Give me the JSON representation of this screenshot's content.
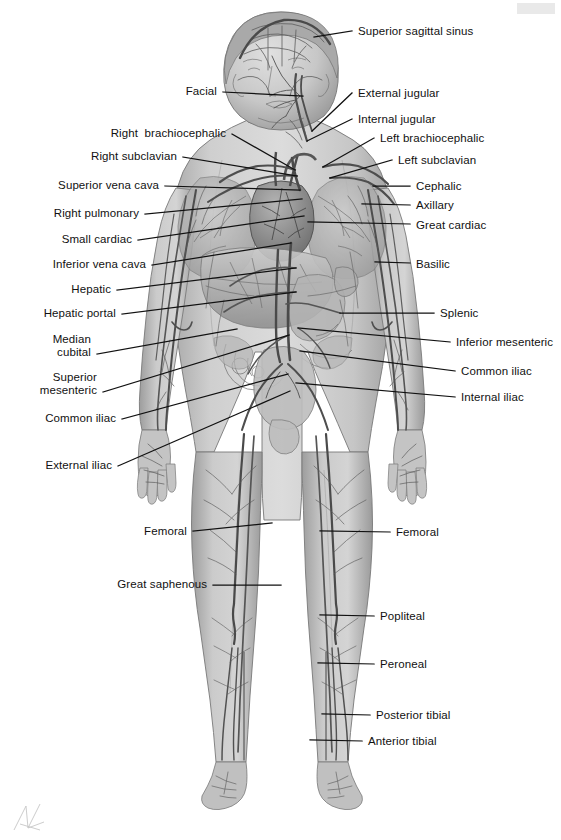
{
  "figure": {
    "view": "anterior full-body",
    "colors": {
      "background": "#ffffff",
      "body_fill_light": "#d2d2d2",
      "body_fill_mid": "#bcbcbc",
      "body_shadow": "#9a9a9a",
      "vessel_dark": "#5e5e5e",
      "vessel_mid": "#7d7d7d",
      "outline": "#6f6f6f",
      "leader_line": "#111111",
      "label_text": "#111111",
      "corner_bar": "#e9e9e9"
    }
  },
  "labels_left": [
    {
      "id": "facial",
      "text": "Facial",
      "x": 178,
      "y": 85,
      "anchor_x": 303,
      "anchor_y": 96,
      "line_x1": 223,
      "line_y1": 92
    },
    {
      "id": "right-brachiocephalic",
      "text": "Right  brachiocephalic",
      "x": 96,
      "y": 127,
      "anchor_x": 295,
      "anchor_y": 170,
      "line_x1": 232,
      "line_y1": 134
    },
    {
      "id": "right-subclavian",
      "text": "Right subclavian",
      "x": 73,
      "y": 150,
      "anchor_x": 297,
      "anchor_y": 176,
      "line_x1": 183,
      "line_y1": 157
    },
    {
      "id": "superior-vena-cava",
      "text": "Superior vena cava",
      "x": 38,
      "y": 179,
      "anchor_x": 300,
      "anchor_y": 190,
      "line_x1": 165,
      "line_y1": 186
    },
    {
      "id": "right-pulmonary",
      "text": "Right pulmonary",
      "x": 32,
      "y": 207,
      "anchor_x": 302,
      "anchor_y": 199,
      "line_x1": 145,
      "line_y1": 214
    },
    {
      "id": "small-cardiac",
      "text": "Small cardiac",
      "x": 48,
      "y": 233,
      "anchor_x": 304,
      "anchor_y": 216,
      "line_x1": 138,
      "line_y1": 240
    },
    {
      "id": "inferior-vena-cava",
      "text": "Inferior vena cava",
      "x": 30,
      "y": 258,
      "anchor_x": 291,
      "anchor_y": 243,
      "line_x1": 152,
      "line_y1": 265
    },
    {
      "id": "hepatic",
      "text": "Hepatic",
      "x": 66,
      "y": 283,
      "anchor_x": 296,
      "anchor_y": 268,
      "line_x1": 117,
      "line_y1": 290
    },
    {
      "id": "hepatic-portal",
      "text": "Hepatic portal",
      "x": 24,
      "y": 307,
      "anchor_x": 296,
      "anchor_y": 292,
      "line_x1": 122,
      "line_y1": 314
    },
    {
      "id": "median-cubital",
      "text": "Median\ncubital",
      "x": 38,
      "y": 333,
      "anchor_x": 237,
      "anchor_y": 329,
      "line_x1": 97,
      "line_y1": 354
    },
    {
      "id": "superior-mesenteric",
      "text": "Superior\nmesenteric",
      "x": 34,
      "y": 371,
      "anchor_x": 289,
      "anchor_y": 335,
      "line_x1": 103,
      "line_y1": 392
    },
    {
      "id": "common-iliac-left",
      "text": "Common iliac",
      "x": 31,
      "y": 412,
      "anchor_x": 288,
      "anchor_y": 374,
      "line_x1": 122,
      "line_y1": 419
    },
    {
      "id": "external-iliac",
      "text": "External iliac",
      "x": 29,
      "y": 459,
      "anchor_x": 290,
      "anchor_y": 391,
      "line_x1": 118,
      "line_y1": 466
    },
    {
      "id": "femoral-left",
      "text": "Femoral",
      "x": 140,
      "y": 525,
      "anchor_x": 272,
      "anchor_y": 523,
      "line_x1": 193,
      "line_y1": 531
    },
    {
      "id": "great-saphenous",
      "text": "Great saphenous",
      "x": 113,
      "y": 578,
      "anchor_x": 281,
      "anchor_y": 585,
      "line_x1": 213,
      "line_y1": 585
    }
  ],
  "labels_right": [
    {
      "id": "superior-sagittal-sinus",
      "text": "Superior sagittal sinus",
      "x": 358,
      "y": 25,
      "anchor_x": 314,
      "anchor_y": 37,
      "line_x1": 352,
      "line_y1": 31
    },
    {
      "id": "external-jugular",
      "text": "External jugular",
      "x": 358,
      "y": 87,
      "anchor_x": 312,
      "anchor_y": 131,
      "line_x1": 352,
      "line_y1": 93
    },
    {
      "id": "internal-jugular",
      "text": "Internal jugular",
      "x": 358,
      "y": 113,
      "anchor_x": 307,
      "anchor_y": 141,
      "line_x1": 352,
      "line_y1": 119
    },
    {
      "id": "left-brachiocephalic",
      "text": "Left brachiocephalic",
      "x": 380,
      "y": 132,
      "anchor_x": 323,
      "anchor_y": 167,
      "line_x1": 374,
      "line_y1": 138
    },
    {
      "id": "left-subclavian",
      "text": "Left subclavian",
      "x": 398,
      "y": 154,
      "anchor_x": 330,
      "anchor_y": 178,
      "line_x1": 392,
      "line_y1": 160
    },
    {
      "id": "cephalic",
      "text": "Cephalic",
      "x": 416,
      "y": 180,
      "anchor_x": 373,
      "anchor_y": 186,
      "line_x1": 410,
      "line_y1": 186
    },
    {
      "id": "axillary",
      "text": "Axillary",
      "x": 416,
      "y": 199,
      "anchor_x": 362,
      "anchor_y": 204,
      "line_x1": 410,
      "line_y1": 205
    },
    {
      "id": "great-cardiac",
      "text": "Great cardiac",
      "x": 416,
      "y": 219,
      "anchor_x": 308,
      "anchor_y": 222,
      "line_x1": 410,
      "line_y1": 224
    },
    {
      "id": "basilic",
      "text": "Basilic",
      "x": 416,
      "y": 258,
      "anchor_x": 375,
      "anchor_y": 262,
      "line_x1": 410,
      "line_y1": 263
    },
    {
      "id": "splenic",
      "text": "Splenic",
      "x": 440,
      "y": 307,
      "anchor_x": 340,
      "anchor_y": 313,
      "line_x1": 434,
      "line_y1": 313
    },
    {
      "id": "inferior-mesenteric",
      "text": "Inferior mesenteric",
      "x": 456,
      "y": 336,
      "anchor_x": 298,
      "anchor_y": 328,
      "line_x1": 450,
      "line_y1": 342
    },
    {
      "id": "common-iliac-right",
      "text": "Common iliac",
      "x": 461,
      "y": 365,
      "anchor_x": 300,
      "anchor_y": 351,
      "line_x1": 455,
      "line_y1": 371
    },
    {
      "id": "internal-iliac",
      "text": "Internal iliac",
      "x": 461,
      "y": 391,
      "anchor_x": 296,
      "anchor_y": 383,
      "line_x1": 455,
      "line_y1": 397
    },
    {
      "id": "femoral-right",
      "text": "Femoral",
      "x": 396,
      "y": 526,
      "anchor_x": 320,
      "anchor_y": 531,
      "line_x1": 390,
      "line_y1": 532
    },
    {
      "id": "popliteal",
      "text": "Popliteal",
      "x": 380,
      "y": 610,
      "anchor_x": 320,
      "anchor_y": 615,
      "line_x1": 374,
      "line_y1": 616
    },
    {
      "id": "peroneal",
      "text": "Peroneal",
      "x": 380,
      "y": 658,
      "anchor_x": 318,
      "anchor_y": 663,
      "line_x1": 374,
      "line_y1": 664
    },
    {
      "id": "posterior-tibial",
      "text": "Posterior tibial",
      "x": 376,
      "y": 709,
      "anchor_x": 322,
      "anchor_y": 714,
      "line_x1": 370,
      "line_y1": 715
    },
    {
      "id": "anterior-tibial",
      "text": "Anterior tibial",
      "x": 368,
      "y": 735,
      "anchor_x": 310,
      "anchor_y": 740,
      "line_x1": 362,
      "line_y1": 741
    }
  ],
  "marks": {
    "corner_bar": "gray-corner-bar",
    "signature": "artist-signature-mark"
  }
}
